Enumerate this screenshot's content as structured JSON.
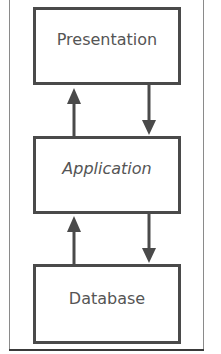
{
  "diagram": {
    "type": "three-tier architecture",
    "layers": [
      {
        "label": "Presentation"
      },
      {
        "label": "Application"
      },
      {
        "label": "Database"
      }
    ],
    "connections": [
      {
        "from": "Application",
        "to": "Presentation",
        "direction": "up"
      },
      {
        "from": "Presentation",
        "to": "Application",
        "direction": "down"
      },
      {
        "from": "Database",
        "to": "Application",
        "direction": "up"
      },
      {
        "from": "Application",
        "to": "Database",
        "direction": "down"
      }
    ],
    "colors": {
      "stroke": "#4a4a4a",
      "text": "#555555",
      "background": "#ffffff"
    }
  }
}
